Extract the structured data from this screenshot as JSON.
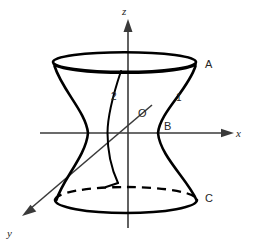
{
  "figure": {
    "background_color": "#ffffff",
    "stroke_color": "#000000",
    "axis_color": "#3a3a3a",
    "axes": [
      {
        "key": "x",
        "label": "x",
        "direction": "right"
      },
      {
        "key": "y",
        "label": "y",
        "direction": "down-left"
      },
      {
        "key": "z",
        "label": "z",
        "direction": "up"
      }
    ],
    "point_labels": [
      {
        "key": "A",
        "label": "A",
        "x": 209,
        "y": 64
      },
      {
        "key": "B",
        "label": "B",
        "x": 168,
        "y": 126
      },
      {
        "key": "C",
        "label": "C",
        "x": 209,
        "y": 198
      },
      {
        "key": "O",
        "label": "O",
        "x": 141,
        "y": 113
      }
    ],
    "curve_labels": [
      {
        "key": "curve-1",
        "label": "1",
        "x": 179,
        "y": 98
      },
      {
        "key": "curve-2",
        "label": "2",
        "x": 114,
        "y": 97
      }
    ],
    "axis_labels": [
      {
        "key": "x",
        "label": "x",
        "x": 238,
        "y": 136
      },
      {
        "key": "y",
        "label": "y",
        "x": 9,
        "y": 234
      },
      {
        "key": "z",
        "label": "z",
        "x": 123,
        "y": 13
      }
    ],
    "geometry_notes": {
      "top_ellipse": "solid full ellipse at top rim",
      "bottom_ellipse": "solid front arc with dashed back arc",
      "waist": "narrowest at origin level",
      "inner_curve": "vertical hyperbola branch labeled 2"
    }
  }
}
